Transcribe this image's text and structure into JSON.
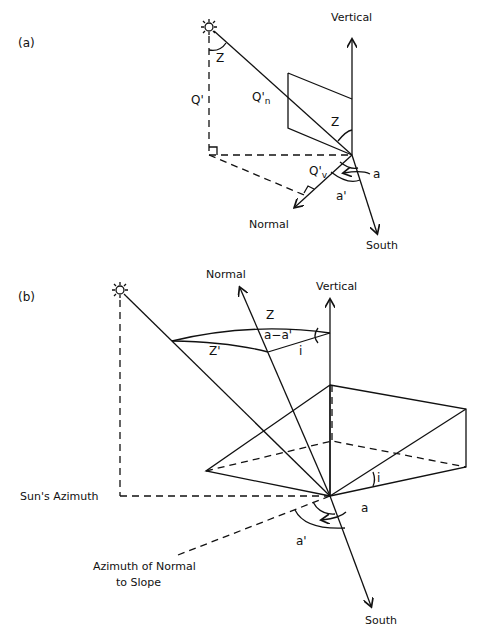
{
  "panel_a": {
    "label": "(a)",
    "vertical": "Vertical",
    "normal": "Normal",
    "south": "South",
    "z_top": "Z",
    "z_mid": "Z",
    "q_prime": "Q'",
    "q_n": "Q'",
    "q_n_sub": "n",
    "q_v": "Q'",
    "q_v_sub": "v",
    "a": "a",
    "a_prime": "a'"
  },
  "panel_b": {
    "label": "(b)",
    "normal": "Normal",
    "vertical": "Vertical",
    "z": "Z",
    "z_prime": "Z'",
    "a_minus_a_prime": "a−a'",
    "i_top": "i",
    "i_slope": "i",
    "suns_azimuth": "Sun's Azimuth",
    "azimuth_normal_line1": "Azimuth of Normal",
    "azimuth_normal_line2": "to Slope",
    "a": "a",
    "a_prime": "a'",
    "south": "South"
  }
}
